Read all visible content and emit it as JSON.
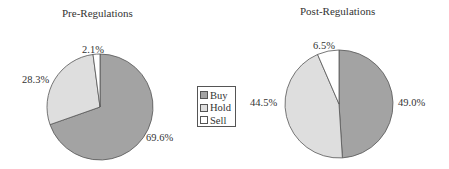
{
  "chart_data": [
    {
      "type": "pie",
      "title": "Pre-Regulations",
      "categories": [
        "Buy",
        "Hold",
        "Sell"
      ],
      "values": [
        69.6,
        28.3,
        2.1
      ],
      "labels": [
        "69.6%",
        "28.3%",
        "2.1%"
      ],
      "colors": [
        "#a3a3a3",
        "#dedede",
        "#ffffff"
      ]
    },
    {
      "type": "pie",
      "title": "Post-Regulations",
      "categories": [
        "Buy",
        "Hold",
        "Sell"
      ],
      "values": [
        49.0,
        44.5,
        6.5
      ],
      "labels": [
        "49.0%",
        "44.5%",
        "6.5%"
      ],
      "colors": [
        "#a3a3a3",
        "#dedede",
        "#ffffff"
      ]
    }
  ],
  "legend": {
    "position": "center",
    "items": [
      {
        "label": "Buy",
        "color": "#a3a3a3"
      },
      {
        "label": "Hold",
        "color": "#dedede"
      },
      {
        "label": "Sell",
        "color": "#ffffff"
      }
    ]
  }
}
